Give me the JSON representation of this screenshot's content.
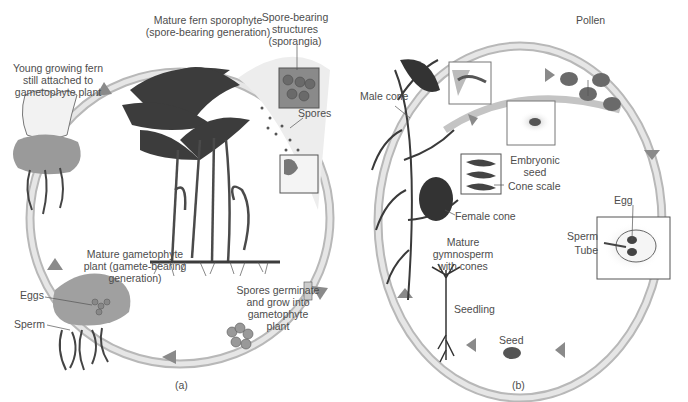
{
  "fern_cycle": {
    "panel_label": "(a)",
    "labels": {
      "sporophyte": "Mature fern sporophyte\n(spore-bearing generation)",
      "sporangia": "Spore-bearing\nstructures\n(sporangia)",
      "spores": "Spores",
      "young_fern": "Young growing fern\nstill attached to\ngametophyte plant",
      "gametophyte": "Mature gametophyte\nplant (gamete-bearing\ngeneration)",
      "eggs": "Eggs",
      "sperm": "Sperm",
      "germinate": "Spores germinate\nand grow into\ngametophyte\nplant"
    }
  },
  "gymnosperm_cycle": {
    "panel_label": "(b)",
    "labels": {
      "pollen": "Pollen",
      "male_cone": "Male cone",
      "embryonic_seed": "Embryonic\nseed",
      "cone_scale": "Cone scale",
      "female_cone": "Female cone",
      "mature_gymnosperm": "Mature gymnosperm\nwith cones",
      "egg": "Egg",
      "sperm": "Sperm",
      "tube": "Tube",
      "seedling": "Seedling",
      "seed": "Seed"
    }
  },
  "colors": {
    "arrow_band": "#d6d6d6",
    "arrow_head": "#8a8a8a",
    "plant_dark": "#3c3c3c",
    "gametophyte": "#9a9a9a"
  }
}
